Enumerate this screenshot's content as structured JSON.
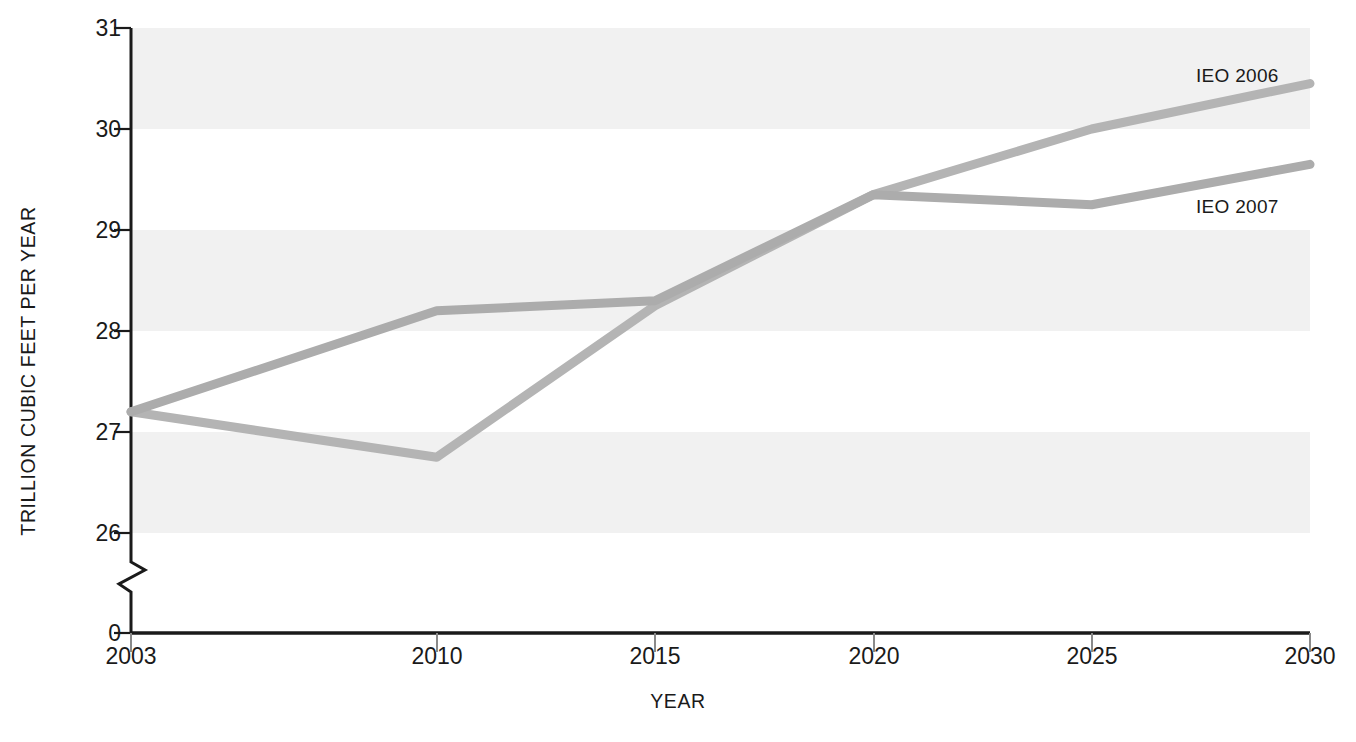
{
  "chart_data": {
    "type": "line",
    "title": "",
    "subtitle": "",
    "xlabel": "YEAR",
    "ylabel": "TRILLION CUBIC FEET PER YEAR",
    "x": [
      2003,
      2010,
      2015,
      2020,
      2025,
      2030
    ],
    "xlim": [
      2003,
      2030
    ],
    "ylim": [
      26,
      31
    ],
    "y_axis_break": true,
    "y_break_label": "0",
    "xticks": [
      "2003",
      "2010",
      "2015",
      "2020",
      "2025",
      "2030"
    ],
    "yticks": [
      "26",
      "27",
      "28",
      "29",
      "30",
      "31"
    ],
    "grid": false,
    "banding": "alternating horizontal bands, shaded every other unit",
    "legend_position": "inline-right-of-series",
    "series": [
      {
        "name": "IEO 2006",
        "color": "#b4b4b4",
        "label_anchor_year": 2030,
        "values": [
          27.2,
          26.75,
          28.25,
          29.35,
          30.0,
          30.45
        ]
      },
      {
        "name": "IEO 2007",
        "color": "#acacac",
        "label_anchor_year": 2030,
        "values": [
          27.2,
          28.2,
          28.3,
          29.35,
          29.25,
          29.65
        ]
      }
    ],
    "annotations": [
      {
        "text": "IEO 2006",
        "near_x": 2029,
        "near_y": 30.75
      },
      {
        "text": "IEO 2007",
        "near_x": 2029,
        "near_y": 29.3
      }
    ]
  },
  "colors": {
    "axis": "#1a1a1a",
    "band_shaded": "#f1f1f1",
    "band_plain": "#ffffff",
    "series_ieo2006": "#b4b4b4",
    "series_ieo2007": "#acacac",
    "text": "#1a1a1a"
  },
  "axes": {
    "y_title": "TRILLION CUBIC FEET PER YEAR",
    "x_title": "YEAR",
    "y_tick_labels": [
      "31",
      "30",
      "29",
      "28",
      "27",
      "26",
      "0"
    ],
    "x_tick_labels": [
      "2003",
      "2010",
      "2015",
      "2020",
      "2025",
      "2030"
    ]
  }
}
